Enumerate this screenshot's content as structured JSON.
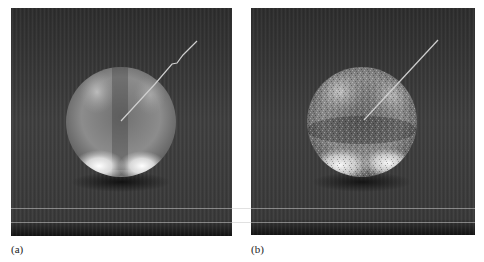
{
  "figure": {
    "panels": [
      {
        "id": "a",
        "label": "(a)",
        "description": "Smooth rendering of a sphere with a thin wire/probe entering from upper right",
        "box": {
          "x": 11,
          "y": 8,
          "w": 221,
          "h": 228
        },
        "sphere": {
          "cx": 121,
          "cy": 122,
          "r": 55
        },
        "probe_line": [
          [
            197,
            41
          ],
          [
            183,
            55
          ],
          [
            177,
            63
          ],
          [
            172,
            64
          ],
          [
            155,
            84
          ],
          [
            121,
            121
          ]
        ],
        "noise": "low"
      },
      {
        "id": "b",
        "label": "(b)",
        "description": "Noisy rendering of the same sphere with a probe line",
        "box": {
          "x": 251,
          "y": 8,
          "w": 224,
          "h": 227
        },
        "sphere": {
          "cx": 362,
          "cy": 122,
          "r": 55
        },
        "probe_line": [
          [
            438,
            40
          ],
          [
            364,
            120
          ]
        ],
        "noise": "high"
      }
    ],
    "colors": {
      "background": "#3a3a3a",
      "background_dark": "#1e1e1e",
      "sphere_mid": "#8a8a8a",
      "highlight": "#f4f4f4",
      "probe": "#cfcfcf",
      "label": "#222222"
    },
    "scan_lines_y": [
      208,
      222
    ]
  }
}
